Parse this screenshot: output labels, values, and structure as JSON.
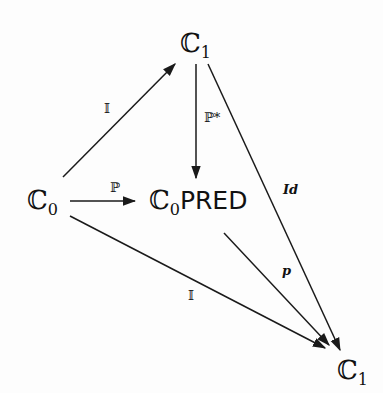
{
  "diagram": {
    "type": "commutative-diagram",
    "nodes": {
      "c1_top": {
        "base": "ℂ",
        "sub": "1"
      },
      "c0_left": {
        "base": "ℂ",
        "sub": "0"
      },
      "c0pred": {
        "base": "ℂ",
        "sub": "0",
        "suffix": "PRED"
      },
      "c1_bottom": {
        "base": "ℂ",
        "sub": "1"
      }
    },
    "edges": [
      {
        "id": "e1",
        "from": "c0_left",
        "to": "c1_top",
        "label": "𝕀"
      },
      {
        "id": "e2",
        "from": "c0_left",
        "to": "c0pred",
        "label": "ℙ"
      },
      {
        "id": "e3",
        "from": "c1_top",
        "to": "c0pred",
        "label": "ℙ*"
      },
      {
        "id": "e4",
        "from": "c1_top",
        "to": "c1_bottom",
        "label": "Id"
      },
      {
        "id": "e5",
        "from": "c0pred",
        "to": "c1_bottom",
        "label": "p"
      },
      {
        "id": "e6",
        "from": "c0_left",
        "to": "c1_bottom",
        "label": "𝕀"
      }
    ],
    "colors": {
      "line": "#1a1a1a",
      "background": "#fdfdfd"
    }
  }
}
